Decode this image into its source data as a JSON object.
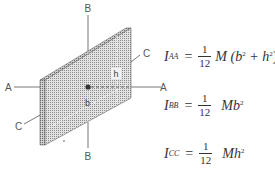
{
  "figure": {
    "type": "moment-of-inertia-thin-plate",
    "axis_labels": {
      "a_left": "A",
      "a_right": "A",
      "b_top": "B",
      "b_bottom": "B",
      "c_left": "C",
      "c_right": "C"
    },
    "dimension_labels": {
      "height": "h",
      "base": "b"
    }
  },
  "equations": [
    {
      "lhs": "I",
      "sub": "AA",
      "num": "1",
      "den": "12",
      "rhs_pre": "M (b",
      "sup1": "2",
      "mid": " + h",
      "sup2": "2",
      "rhs_post": ")"
    },
    {
      "lhs": "I",
      "sub": "BB",
      "num": "1",
      "den": "12",
      "rhs_pre": "Mb",
      "sup1": "2"
    },
    {
      "lhs": "I",
      "sub": "CC",
      "num": "1",
      "den": "12",
      "rhs_pre": "Mh",
      "sup1": "2"
    }
  ],
  "colors": {
    "line": "#555555",
    "plate_fill": "#c9c9c9",
    "plate_edge": "#9a9a9a",
    "text": "#333333"
  }
}
